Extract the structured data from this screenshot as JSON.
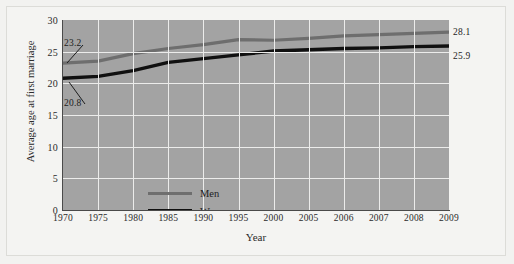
{
  "chart_data": {
    "type": "line",
    "title": "",
    "xlabel": "Year",
    "ylabel": "Average age at first marriage",
    "categories": [
      "1970",
      "1975",
      "1980",
      "1985",
      "1990",
      "1995",
      "2000",
      "2005",
      "2006",
      "2007",
      "2008",
      "2009"
    ],
    "ylim": [
      0,
      30
    ],
    "yticks": [
      "0",
      "5",
      "10",
      "15",
      "20",
      "25",
      "30"
    ],
    "grid": true,
    "legend_position": "inside-lower-left",
    "series": [
      {
        "name": "Men",
        "color": "#6e6e6e",
        "values": [
          23.2,
          23.5,
          24.7,
          25.5,
          26.1,
          26.9,
          26.8,
          27.1,
          27.5,
          27.7,
          27.9,
          28.1
        ],
        "start_label": "23.2",
        "end_label": "28.1"
      },
      {
        "name": "Women",
        "color": "#101010",
        "values": [
          20.8,
          21.1,
          22.0,
          23.3,
          23.9,
          24.5,
          25.1,
          25.3,
          25.5,
          25.6,
          25.8,
          25.9
        ],
        "start_label": "20.8",
        "end_label": "25.9"
      }
    ],
    "annotations": [
      {
        "text": "23.2",
        "series": "Men",
        "at": "1970"
      },
      {
        "text": "20.8",
        "series": "Women",
        "at": "1970"
      },
      {
        "text": "28.1",
        "series": "Men",
        "at": "2009"
      },
      {
        "text": "25.9",
        "series": "Women",
        "at": "2009"
      }
    ],
    "colors": {
      "plot_background": "#a3a3a3",
      "gridline": "#ececeb",
      "figure_background": "#f4f4f2",
      "axis": "#4a4a4a",
      "men_line": "#6e6e6e",
      "women_line": "#101010"
    }
  }
}
